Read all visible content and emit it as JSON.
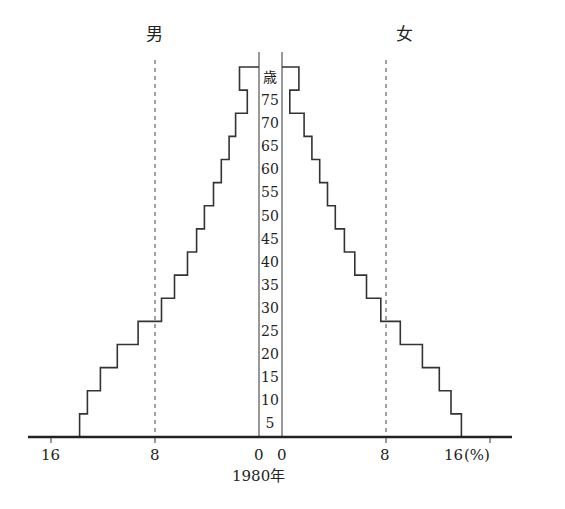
{
  "chart_data": {
    "type": "bar",
    "subtype": "population-pyramid",
    "title": "1980年",
    "left_label": "男",
    "right_label": "女",
    "age_unit_label": "歳",
    "xlabel": "(%)",
    "x_ticks_left": [
      "16",
      "8",
      "0"
    ],
    "x_ticks_right": [
      "0",
      "8",
      "16"
    ],
    "x_unit": "(%)",
    "xlim": [
      0,
      16
    ],
    "reference_lines": [
      8
    ],
    "age_tick_labels": [
      "5",
      "10",
      "15",
      "20",
      "25",
      "30",
      "35",
      "40",
      "45",
      "50",
      "55",
      "60",
      "65",
      "70",
      "75"
    ],
    "categories": [
      "0-4",
      "5-9",
      "10-14",
      "15-19",
      "20-24",
      "25-29",
      "30-34",
      "35-39",
      "40-44",
      "45-49",
      "50-54",
      "55-59",
      "60-64",
      "65-69",
      "70-74",
      "75+"
    ],
    "series": [
      {
        "name": "男",
        "values": [
          13.8,
          13.2,
          12.2,
          10.9,
          9.3,
          7.5,
          6.5,
          5.5,
          4.8,
          4.2,
          3.5,
          2.9,
          2.3,
          1.8,
          0.9,
          1.5
        ]
      },
      {
        "name": "女",
        "values": [
          13.8,
          13.0,
          12.1,
          10.8,
          9.1,
          7.6,
          6.5,
          5.6,
          4.8,
          4.1,
          3.5,
          2.9,
          2.3,
          1.7,
          0.6,
          1.3
        ]
      }
    ],
    "grid": false,
    "legend": "none"
  },
  "labels": {
    "male": "男",
    "female": "女",
    "age_unit": "歳",
    "year": "1980年",
    "tick_16_left": "16",
    "tick_8_left": "8",
    "tick_0_left": "0",
    "tick_0_right": "0",
    "tick_8_right": "8",
    "tick_16_right": "16",
    "unit": "(%)",
    "ages": [
      "75",
      "70",
      "65",
      "60",
      "55",
      "50",
      "45",
      "40",
      "35",
      "30",
      "25",
      "20",
      "15",
      "10",
      "5"
    ]
  }
}
